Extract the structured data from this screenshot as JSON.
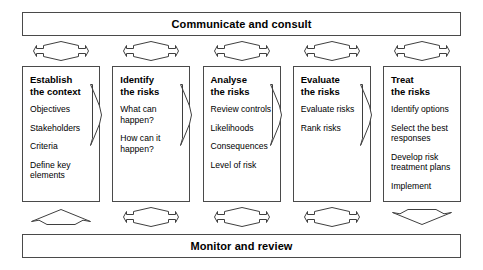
{
  "diagram": {
    "title_top": "Communicate and consult",
    "title_bottom": "Monitor and review",
    "stroke_color": "#3f3f3f",
    "background_color": "#ffffff",
    "text_color": "#000000"
  },
  "stages": [
    {
      "title": "Establish\nthe context",
      "items": [
        "Objectives",
        "Stakeholders",
        "Criteria",
        "Define key\nelements"
      ]
    },
    {
      "title": "Identify\nthe risks",
      "items": [
        "What can\nhappen?",
        "How can it\nhappen?"
      ]
    },
    {
      "title": "Analyse\nthe risks",
      "items": [
        "Review controls",
        "Likelihoods",
        "Consequences",
        "Level of risk"
      ]
    },
    {
      "title": "Evaluate\nthe risks",
      "items": [
        "Evaluate risks",
        "Rank risks"
      ]
    },
    {
      "title": "Treat\nthe risks",
      "items": [
        "Identify options",
        "Select the best\nresponses",
        "Develop risk\ntreatment plans",
        "Implement"
      ]
    }
  ],
  "connectors": {
    "top_arrows": [
      "double-headed-horizontal-arrow-icon",
      "double-headed-horizontal-arrow-icon",
      "double-headed-horizontal-arrow-icon",
      "double-headed-horizontal-arrow-icon",
      "double-headed-horizontal-arrow-icon"
    ],
    "bottom_arrows": [
      "up-arrow-icon",
      "double-headed-horizontal-arrow-icon",
      "double-headed-horizontal-arrow-icon",
      "double-headed-horizontal-arrow-icon",
      "down-arrow-icon"
    ],
    "stage_flow_arrows": [
      "right-arrow-icon",
      "right-arrow-icon",
      "right-arrow-icon",
      "right-arrow-icon"
    ]
  }
}
